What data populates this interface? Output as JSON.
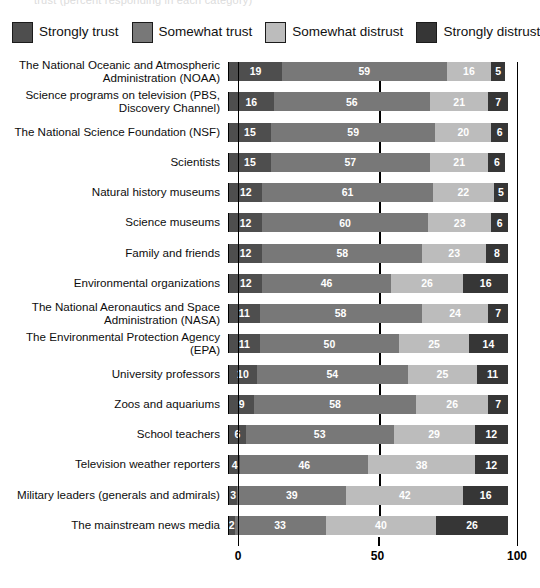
{
  "clipped_title": "trust (percent responding in each category)",
  "legend": {
    "items": [
      {
        "label": "Strongly trust",
        "color": "#4e4e4e",
        "icon": "legend-swatch-icon"
      },
      {
        "label": "Somewhat trust",
        "color": "#787878",
        "icon": "legend-swatch-icon"
      },
      {
        "label": "Somewhat distrust",
        "color": "#bcbcbc",
        "icon": "legend-swatch-icon"
      },
      {
        "label": "Strongly distrust",
        "color": "#363636",
        "icon": "legend-swatch-icon"
      }
    ]
  },
  "chart_data": {
    "type": "bar",
    "orientation": "horizontal",
    "stacked": true,
    "stack_mode": "percent",
    "title": "",
    "subtitle": "",
    "xlabel": "",
    "ylabel": "",
    "xlim": [
      0,
      100
    ],
    "xticks": [
      0,
      50,
      100
    ],
    "xticklabels": [
      "0",
      "50",
      "100"
    ],
    "grid": false,
    "legend_position": "top",
    "reference_line": 50,
    "series": [
      {
        "name": "Strongly trust",
        "color": "#4e4e4e",
        "values": [
          19,
          16,
          15,
          15,
          12,
          12,
          12,
          12,
          11,
          11,
          10,
          9,
          6,
          4,
          3,
          2
        ]
      },
      {
        "name": "Somewhat trust",
        "color": "#787878",
        "values": [
          59,
          56,
          59,
          57,
          61,
          60,
          58,
          46,
          58,
          50,
          54,
          58,
          53,
          46,
          39,
          33
        ]
      },
      {
        "name": "Somewhat distrust",
        "color": "#bcbcbc",
        "values": [
          16,
          21,
          20,
          21,
          22,
          23,
          23,
          26,
          24,
          25,
          25,
          26,
          29,
          38,
          42,
          40
        ]
      },
      {
        "name": "Strongly distrust",
        "color": "#363636",
        "values": [
          5,
          7,
          6,
          6,
          5,
          6,
          8,
          16,
          7,
          14,
          11,
          7,
          12,
          12,
          16,
          26
        ]
      }
    ],
    "categories": [
      "The National Oceanic and Atmospheric Administration (NOAA)",
      "Science programs on television (PBS, Discovery Channel)",
      "The National Science Foundation (NSF)",
      "Scientists",
      "Natural history museums",
      "Science museums",
      "Family and friends",
      "Environmental organizations",
      "The National Aeronautics and Space Administration (NASA)",
      "The Environmental Protection Agency (EPA)",
      "University professors",
      "Zoos and aquariums",
      "School teachers",
      "Television weather reporters",
      "Military leaders (generals and admirals)",
      "The mainstream news media"
    ],
    "category_lines": [
      [
        "The National Oceanic and Atmospheric",
        "Administration (NOAA)"
      ],
      [
        "Science programs on television (PBS,",
        "Discovery Channel)"
      ],
      [
        "The National Science Foundation (NSF)"
      ],
      [
        "Scientists"
      ],
      [
        "Natural history museums"
      ],
      [
        "Science museums"
      ],
      [
        "Family and friends"
      ],
      [
        "Environmental organizations"
      ],
      [
        "The National Aeronautics and Space",
        "Administration (NASA)"
      ],
      [
        "The Environmental Protection Agency (EPA)"
      ],
      [
        "University professors"
      ],
      [
        "Zoos and aquariums"
      ],
      [
        "School teachers"
      ],
      [
        "Television weather reporters"
      ],
      [
        "Military leaders (generals and admirals)"
      ],
      [
        "The mainstream news media"
      ]
    ]
  }
}
